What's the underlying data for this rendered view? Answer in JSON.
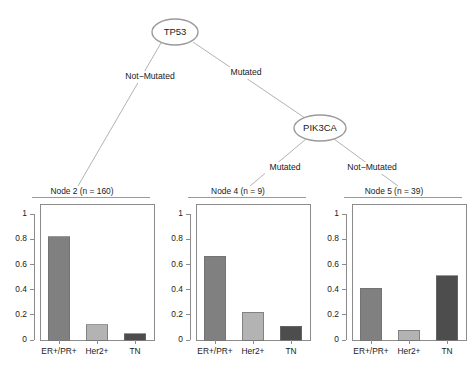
{
  "figure": {
    "kind": "classification-tree-with-barplots",
    "background": "#ffffff"
  },
  "tree": {
    "nodes": [
      {
        "id": "root",
        "label": "TP53",
        "cx": 175,
        "cy": 32,
        "rx": 23,
        "ry": 13
      },
      {
        "id": "inner2",
        "label": "PIK3CA",
        "cx": 320,
        "cy": 128,
        "rx": 26,
        "ry": 13
      }
    ],
    "edges": [
      {
        "from": "root",
        "to": "node2",
        "label": "Not-Mutated",
        "x1": 161,
        "y1": 43,
        "x2": 78,
        "y2": 186,
        "lx": 150,
        "ly": 77
      },
      {
        "from": "root",
        "to": "inner2",
        "label": "Mutated",
        "x1": 193,
        "y1": 42,
        "x2": 305,
        "y2": 118,
        "lx": 246,
        "ly": 73
      },
      {
        "from": "inner2",
        "to": "node4",
        "label": "Mutated",
        "x1": 306,
        "y1": 139,
        "x2": 250,
        "y2": 186,
        "lx": 285,
        "ly": 168
      },
      {
        "from": "inner2",
        "to": "node5",
        "label": "Not-Mutated",
        "x1": 334,
        "y1": 139,
        "x2": 398,
        "y2": 186,
        "lx": 372,
        "ly": 168
      }
    ]
  },
  "panels": [
    {
      "id": "node2",
      "title": "Node 2 (n = 160)"
    },
    {
      "id": "node4",
      "title": "Node 4 (n = 9)"
    },
    {
      "id": "node5",
      "title": "Node 5 (n = 39)"
    }
  ],
  "colors": {
    "bar_er_pr": "#808080",
    "bar_her2": "#b3b3b3",
    "bar_tn": "#4d4d4d",
    "bar_border": "#6e6e6e",
    "axis": "#8c8c8c",
    "node_stroke": "#9a9a9a",
    "edge_stroke": "#a9a9a9",
    "text": "#1a1a1a"
  },
  "chart_data": [
    {
      "type": "bar",
      "title": "Node 2 (n = 160)",
      "categories": [
        "ER+/PR+",
        "Her2+",
        "TN"
      ],
      "values": [
        0.82,
        0.12,
        0.05
      ],
      "colors": [
        "#808080",
        "#b3b3b3",
        "#4d4d4d"
      ],
      "xlabel": "",
      "ylabel": "",
      "ylim": [
        0,
        1.08
      ],
      "yticks": [
        0,
        0.2,
        0.4,
        0.6,
        0.8,
        1
      ],
      "ytick_labels": [
        "0",
        "0.2",
        "0.4",
        "0.6",
        "0.8",
        "1"
      ],
      "grid": false,
      "legend": "none"
    },
    {
      "type": "bar",
      "title": "Node 4 (n = 9)",
      "categories": [
        "ER+/PR+",
        "Her2+",
        "TN"
      ],
      "values": [
        0.667,
        0.222,
        0.111
      ],
      "colors": [
        "#808080",
        "#b3b3b3",
        "#4d4d4d"
      ],
      "xlabel": "",
      "ylabel": "",
      "ylim": [
        0,
        1.08
      ],
      "yticks": [
        0,
        0.2,
        0.4,
        0.6,
        0.8,
        1
      ],
      "ytick_labels": [
        "0",
        "0.2",
        "0.4",
        "0.6",
        "0.8",
        "1"
      ],
      "grid": false,
      "legend": "none"
    },
    {
      "type": "bar",
      "title": "Node 5 (n = 39)",
      "categories": [
        "ER+/PR+",
        "Her2+",
        "TN"
      ],
      "values": [
        0.41,
        0.077,
        0.51
      ],
      "colors": [
        "#808080",
        "#b3b3b3",
        "#4d4d4d"
      ],
      "xlabel": "",
      "ylabel": "",
      "ylim": [
        0,
        1.08
      ],
      "yticks": [
        0,
        0.2,
        0.4,
        0.6,
        0.8,
        1
      ],
      "ytick_labels": [
        "0",
        "0.2",
        "0.4",
        "0.6",
        "0.8",
        "1"
      ],
      "grid": false,
      "legend": "none"
    }
  ]
}
